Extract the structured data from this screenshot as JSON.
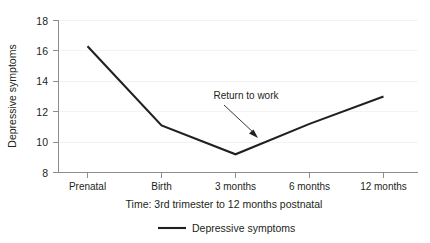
{
  "chart_data": {
    "type": "line",
    "title": "",
    "xlabel": "Time: 3rd trimester to 12 months postnatal",
    "ylabel": "Depressive symptoms",
    "categories": [
      "Prenatal",
      "Birth",
      "3 months",
      "6 months",
      "12 months"
    ],
    "values": [
      16.3,
      11.1,
      9.2,
      11.2,
      13.0
    ],
    "series": [
      {
        "name": "Depressive symptoms",
        "values": [
          16.3,
          11.1,
          9.2,
          11.2,
          13.0
        ]
      }
    ],
    "ylim": [
      8,
      18
    ],
    "yticks": [
      8,
      10,
      12,
      14,
      16,
      18
    ],
    "ytick_labels": [
      "8",
      "10",
      "12",
      "14",
      "16",
      "18"
    ],
    "xtick_labels": [
      "Prenatal",
      "Birth",
      "3 months",
      "6 months",
      "12 months"
    ],
    "grid": true,
    "legend_position": "bottom",
    "line_color": "#231f20",
    "axis_color": "#8c8c8c",
    "grid_color": "#f0f0f0",
    "annotations": [
      {
        "text": "Return to work",
        "points_to_category": "3 months",
        "points_to_value": 9.8
      }
    ]
  },
  "legend": {
    "entries": [
      {
        "label": "Depressive symptoms"
      }
    ]
  },
  "axes": {
    "y_title": "Depressive symptoms",
    "x_title": "Time: 3rd trimester to 12 months postnatal",
    "y_labels": [
      "18",
      "16",
      "14",
      "12",
      "10",
      "8"
    ],
    "x_labels": [
      "Prenatal",
      "Birth",
      "3 months",
      "6 months",
      "12 months"
    ]
  },
  "annotation": {
    "label": "Return to work"
  }
}
